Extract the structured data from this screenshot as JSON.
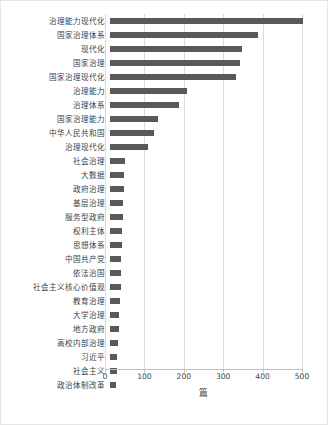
{
  "chart_data": {
    "type": "bar",
    "orientation": "horizontal",
    "title": "",
    "xlabel": "篇",
    "ylabel": "",
    "xlim": [
      0,
      500
    ],
    "xticks": [
      0,
      100,
      200,
      300,
      400,
      500
    ],
    "grid": true,
    "legend": false,
    "bar_color": "#595959",
    "categories": [
      "治理能力现代化",
      "国家治理体系",
      "现代化",
      "国家治理",
      "国家治理现代化",
      "治理能力",
      "治理体系",
      "国家治理能力",
      "中华人民共和国",
      "治理现代化",
      "社会治理",
      "大数据",
      "政府治理",
      "基层治理",
      "服务型政府",
      "权利主体",
      "思想体系",
      "中国共产党",
      "依法治国",
      "社会主义核心价值观",
      "教育治理",
      "大学治理",
      "地方政府",
      "高校内部治理",
      "习近平",
      "社会主义",
      "政治体制改革"
    ],
    "values": [
      489,
      375,
      334,
      331,
      319,
      195,
      174,
      121,
      112,
      96,
      38,
      36,
      35,
      34,
      33,
      31,
      30,
      29,
      28,
      27,
      25,
      24,
      22,
      21,
      19,
      18,
      16
    ]
  }
}
